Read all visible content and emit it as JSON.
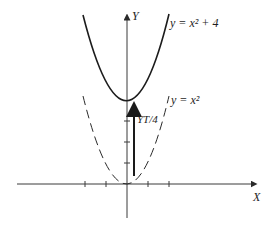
{
  "diagram": {
    "axes": {
      "x_label": "X",
      "y_label": "Y",
      "origin_px": [
        127,
        184
      ],
      "unit_px": 21,
      "x_ticks": [
        -2,
        -1,
        1,
        2
      ],
      "y_ticks": [
        1,
        2,
        3
      ]
    },
    "curves": [
      {
        "name": "shifted-parabola",
        "equation": "y = x² + 4",
        "style": "solid",
        "label": "y = x² + 4"
      },
      {
        "name": "base-parabola",
        "equation": "y = x²",
        "style": "dashed",
        "label": "y = x²"
      }
    ],
    "translation_arrow": {
      "label": "YT/4",
      "from": [
        0,
        0
      ],
      "to": [
        0,
        4
      ]
    },
    "colors": {
      "stroke": "#1c1c1c",
      "background": "#ffffff"
    }
  }
}
